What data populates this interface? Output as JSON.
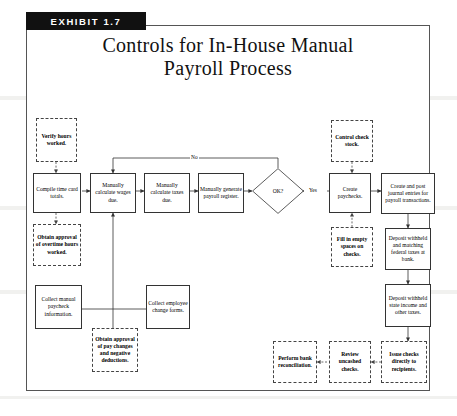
{
  "exhibit": {
    "tag": "EXHIBIT 1.7",
    "title_line1": "Controls for In-House Manual",
    "title_line2": "Payroll Process"
  },
  "diagram": {
    "type": "flowchart",
    "orientation": "left-to-right",
    "legend": {
      "solid_box": "process step",
      "dashed_box": "control",
      "diamond": "decision"
    },
    "nodes": [
      {
        "id": "verify-hours",
        "label": "Verify hours worked.",
        "shape": "dashed-box"
      },
      {
        "id": "compile-time-card",
        "label": "Compile time card totals.",
        "shape": "solid-box"
      },
      {
        "id": "obtain-overtime",
        "label": "Obtain approval of overtime hours worked.",
        "shape": "dashed-box"
      },
      {
        "id": "calc-wages",
        "label": "Manually calculate wages due.",
        "shape": "solid-box"
      },
      {
        "id": "calc-taxes",
        "label": "Manually calculate taxes due.",
        "shape": "solid-box"
      },
      {
        "id": "generate-register",
        "label": "Manually generate payroll register.",
        "shape": "solid-box"
      },
      {
        "id": "ok-decision",
        "label": "OK?",
        "shape": "diamond"
      },
      {
        "id": "control-check-stock",
        "label": "Control check stock.",
        "shape": "dashed-box"
      },
      {
        "id": "create-paychecks",
        "label": "Create paychecks.",
        "shape": "solid-box"
      },
      {
        "id": "fill-empty-spaces",
        "label": "Fill in empty spaces on checks.",
        "shape": "dashed-box"
      },
      {
        "id": "journal-entries",
        "label": "Create and post journal entries for payroll transactions.",
        "shape": "solid-box"
      },
      {
        "id": "deposit-federal",
        "label": "Deposit withheld and matching federal taxes at bank.",
        "shape": "solid-box"
      },
      {
        "id": "deposit-state",
        "label": "Deposit withheld state income and other taxes.",
        "shape": "solid-box"
      },
      {
        "id": "collect-manual",
        "label": "Collect manual paycheck information.",
        "shape": "solid-box"
      },
      {
        "id": "collect-change",
        "label": "Collect employee change forms.",
        "shape": "solid-box"
      },
      {
        "id": "obtain-pay-changes",
        "label": "Obtain approval of pay changes and negative deductions.",
        "shape": "dashed-box"
      },
      {
        "id": "perform-bank-recon",
        "label": "Perform bank reconciliation.",
        "shape": "dashed-box"
      },
      {
        "id": "review-uncashed",
        "label": "Review uncashed checks.",
        "shape": "dashed-box"
      },
      {
        "id": "issue-checks",
        "label": "Issue checks directly to recipients.",
        "shape": "dashed-box"
      }
    ],
    "edge_labels": {
      "no": "No",
      "yes": "Yes"
    },
    "edges": [
      {
        "from": "compile-time-card",
        "to": "calc-wages"
      },
      {
        "from": "calc-wages",
        "to": "calc-taxes"
      },
      {
        "from": "calc-taxes",
        "to": "generate-register"
      },
      {
        "from": "generate-register",
        "to": "ok-decision"
      },
      {
        "from": "ok-decision",
        "to": "calc-wages",
        "label": "No"
      },
      {
        "from": "ok-decision",
        "to": "create-paychecks",
        "label": "Yes"
      },
      {
        "from": "control-check-stock",
        "to": "create-paychecks"
      },
      {
        "from": "fill-empty-spaces",
        "to": "create-paychecks"
      },
      {
        "from": "create-paychecks",
        "to": "journal-entries"
      },
      {
        "from": "journal-entries",
        "to": "deposit-federal"
      },
      {
        "from": "deposit-federal",
        "to": "deposit-state"
      },
      {
        "from": "deposit-state",
        "to": "issue-checks"
      },
      {
        "from": "issue-checks",
        "to": "review-uncashed"
      },
      {
        "from": "review-uncashed",
        "to": "perform-bank-recon"
      },
      {
        "from": "verify-hours",
        "to": "compile-time-card"
      },
      {
        "from": "compile-time-card",
        "to": "obtain-overtime"
      },
      {
        "from": "collect-manual",
        "to": "calc-wages"
      },
      {
        "from": "collect-change",
        "to": "calc-wages"
      },
      {
        "from": "obtain-pay-changes",
        "to": "calc-wages"
      }
    ]
  },
  "colors": {
    "tag_background": "#111111",
    "tag_text": "#ffffff",
    "frame_border": "#555555",
    "node_border": "#333333",
    "line": "#444444",
    "page_background": "#ffffff"
  }
}
